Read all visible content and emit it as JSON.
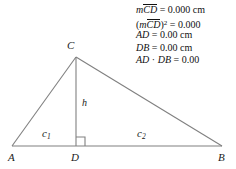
{
  "figure": {
    "type": "right-triangle-altitude-diagram",
    "stroke_color": "#808080",
    "text_color": "#1a1a1a",
    "background": "#ffffff",
    "points": {
      "A": {
        "x": 12,
        "y": 146
      },
      "B": {
        "x": 222,
        "y": 146
      },
      "C": {
        "x": 76,
        "y": 57
      },
      "D": {
        "x": 76,
        "y": 146
      }
    },
    "segments": [
      {
        "name": "AC",
        "from": "A",
        "to": "C"
      },
      {
        "name": "CB",
        "from": "C",
        "to": "B"
      },
      {
        "name": "AB",
        "from": "A",
        "to": "B"
      },
      {
        "name": "CD",
        "from": "C",
        "to": "D"
      }
    ],
    "right_angle_marker": {
      "at": "D",
      "size": 9,
      "side": "right"
    },
    "labels": {
      "A": "A",
      "B": "B",
      "C": "C",
      "D": "D",
      "h": "h",
      "c1_base": "c",
      "c1_sub": "1",
      "c2_base": "c",
      "c2_sub": "2"
    }
  },
  "measurements": {
    "rows": [
      {
        "id": "m-cd",
        "prefix_italic": "m",
        "overline": "CD",
        "superscript": "",
        "relation": " = ",
        "value": "0.000",
        "unit": " cm",
        "open_paren": "",
        "close_paren": ""
      },
      {
        "id": "m-cd-squared",
        "prefix_italic": "m",
        "overline": "CD",
        "superscript": "2",
        "relation": " = ",
        "value": "0.000",
        "unit": "",
        "open_paren": "(",
        "close_paren": ")"
      },
      {
        "id": "ad",
        "label": "AD",
        "relation": " = ",
        "value": "0.00",
        "unit": " cm"
      },
      {
        "id": "db",
        "label": "DB",
        "relation": " = ",
        "value": "0.00",
        "unit": " cm"
      },
      {
        "id": "ad-times-db",
        "label_left": "AD",
        "operator": " · ",
        "label_right": "DB",
        "relation": " = ",
        "value": "0.00",
        "unit": ""
      }
    ]
  }
}
